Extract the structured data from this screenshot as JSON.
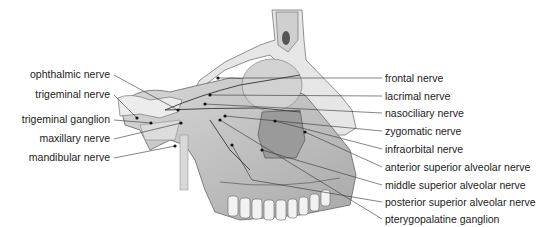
{
  "figure": {
    "left_labels": [
      {
        "text": "ophthalmic nerve",
        "x": 110,
        "y": 74
      },
      {
        "text": "trigeminal nerve",
        "x": 110,
        "y": 94
      },
      {
        "text": "trigeminal ganglion",
        "x": 110,
        "y": 119
      },
      {
        "text": "maxillary nerve",
        "x": 110,
        "y": 138
      },
      {
        "text": "mandibular nerve",
        "x": 110,
        "y": 157
      }
    ],
    "right_labels": [
      {
        "text": "frontal nerve",
        "x": 385,
        "y": 75
      },
      {
        "text": "lacrimal nerve",
        "x": 385,
        "y": 93
      },
      {
        "text": "nasociliary nerve",
        "x": 385,
        "y": 111
      },
      {
        "text": "zygomatic nerve",
        "x": 385,
        "y": 128
      },
      {
        "text": "infraorbital nerve",
        "x": 385,
        "y": 146
      },
      {
        "text": "anterior superior alveolar nerve",
        "x": 385,
        "y": 164
      },
      {
        "text": "middle superior alveolar nerve",
        "x": 385,
        "y": 182
      },
      {
        "text": "posterior superior alveolar nerve",
        "x": 385,
        "y": 199
      },
      {
        "text": "pterygopalatine ganglion",
        "x": 385,
        "y": 216
      }
    ]
  }
}
